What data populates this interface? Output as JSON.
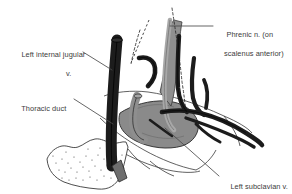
{
  "figure": {
    "background_color": "#ffffff"
  },
  "labels": {
    "internal_jugular": {
      "line1": "Left internal jugular",
      "line2": "v."
    },
    "thoracic_duct": {
      "line1": "Thoracic duct"
    },
    "phrenic_nerve": {
      "line1": "Phrenic n. (on",
      "line2": "scalenus anterior)"
    },
    "subclavian_vein": {
      "line1": "Left subclavian v."
    }
  },
  "colors": {
    "vessel_dark": "#1a1a1a",
    "vessel_mid": "#2e2e2e",
    "muscle_gray": "#8a8a8a",
    "duct_gray": "#9a9a9a",
    "bone_outline": "#333333",
    "leader_line": "#555555",
    "text": "#3b3b3b"
  },
  "structures": [
    {
      "name": "left-internal-jugular-vein",
      "tone": "dark"
    },
    {
      "name": "thoracic-duct",
      "tone": "gray"
    },
    {
      "name": "phrenic-nerve",
      "tone": "gray"
    },
    {
      "name": "scalenus-anterior-muscle",
      "tone": "gray"
    },
    {
      "name": "left-subclavian-vein",
      "tone": "gray"
    },
    {
      "name": "brachial-plexus-trunks",
      "tone": "dark"
    },
    {
      "name": "clavicle-bone-stippled",
      "tone": "outline"
    }
  ]
}
